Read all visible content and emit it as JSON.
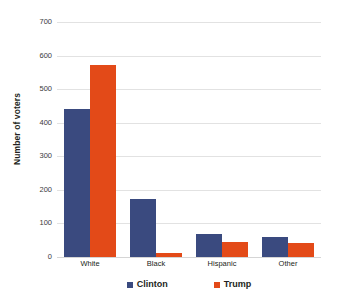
{
  "chart_data": {
    "type": "bar",
    "title": "",
    "subtitle": "",
    "xlabel": "",
    "ylabel": "Number of voters",
    "categories": [
      "White",
      "Black",
      "Hispanic",
      "Other"
    ],
    "series": [
      {
        "name": "Clinton",
        "color": "#3a4a7f",
        "values": [
          440,
          172,
          68,
          60
        ]
      },
      {
        "name": "Trump",
        "color": "#e34a18",
        "values": [
          572,
          12,
          44,
          42
        ]
      }
    ],
    "ylim": [
      0,
      700
    ],
    "yticks": [
      0,
      100,
      200,
      300,
      400,
      500,
      600,
      700
    ],
    "ytick_labels": [
      "0",
      "100",
      "200",
      "300",
      "400",
      "500",
      "600",
      "700"
    ],
    "grid": true,
    "legend_position": "bottom",
    "legend_entries": [
      "Clinton",
      "Trump"
    ]
  }
}
